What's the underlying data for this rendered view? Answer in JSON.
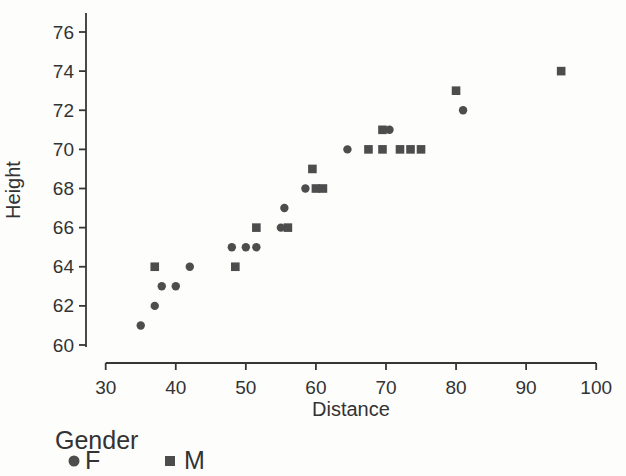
{
  "figure": {
    "background": "#fdfdfc",
    "marker_color": "#4d4d4d",
    "axis_color": "#363636",
    "text_color": "#333333"
  },
  "chart_data": {
    "type": "scatter",
    "title": "",
    "xlabel": "Distance",
    "ylabel": "Height",
    "xlim": [
      30,
      100
    ],
    "ylim": [
      60,
      76
    ],
    "x_ticks": [
      30,
      40,
      50,
      60,
      70,
      80,
      90,
      100
    ],
    "y_ticks": [
      60,
      62,
      64,
      66,
      68,
      70,
      72,
      74,
      76
    ],
    "grid": false,
    "legend": {
      "title": "Gender",
      "position": "bottom-left",
      "entries": [
        {
          "name": "F",
          "marker": "circle"
        },
        {
          "name": "M",
          "marker": "square"
        }
      ]
    },
    "series": [
      {
        "name": "F",
        "marker": "circle",
        "points": [
          [
            35,
            61
          ],
          [
            37,
            62
          ],
          [
            38,
            63
          ],
          [
            40,
            63
          ],
          [
            42,
            64
          ],
          [
            48,
            65
          ],
          [
            50,
            65
          ],
          [
            51.5,
            65
          ],
          [
            55,
            66
          ],
          [
            55.5,
            67
          ],
          [
            58.5,
            68
          ],
          [
            64.5,
            70
          ],
          [
            70.5,
            71
          ],
          [
            81,
            72
          ]
        ]
      },
      {
        "name": "M",
        "marker": "square",
        "points": [
          [
            37,
            64
          ],
          [
            48.5,
            64
          ],
          [
            51.5,
            66
          ],
          [
            56,
            66
          ],
          [
            60,
            68
          ],
          [
            61,
            68
          ],
          [
            59.5,
            69
          ],
          [
            67.5,
            70
          ],
          [
            69.5,
            70
          ],
          [
            72,
            70
          ],
          [
            73.5,
            70
          ],
          [
            75,
            70
          ],
          [
            69.5,
            71
          ],
          [
            80,
            73
          ],
          [
            95,
            74
          ]
        ]
      }
    ]
  }
}
